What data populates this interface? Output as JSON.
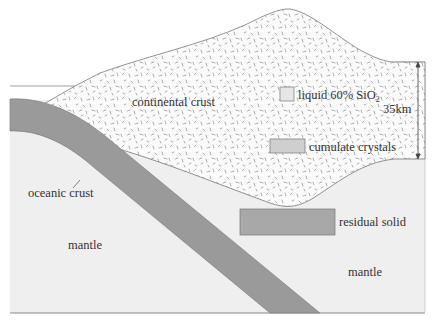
{
  "diagram": {
    "type": "subduction-zone cross-section",
    "colors": {
      "background": "#ffffff",
      "mantle": "#efefef",
      "oceanic_crust": "#9a9a9a",
      "continental_crust_fill": "#fbfbfb",
      "speckle": "#8a8a8a",
      "residual_solid": "#a8a8a8",
      "cumulate_crystals": "#cfcfcf",
      "liquid": "#e6e6e6",
      "outline": "#777777"
    },
    "labels": {
      "continental_crust": "continental crust",
      "liquid": "liquid 60% SiO",
      "liquid_subscript": "2",
      "scale": "35km",
      "cumulate": "cumulate crystals",
      "oceanic_crust": "oceanic crust",
      "mantle_left": "mantle",
      "residual_solid": "residual solid",
      "mantle_right": "mantle"
    }
  }
}
